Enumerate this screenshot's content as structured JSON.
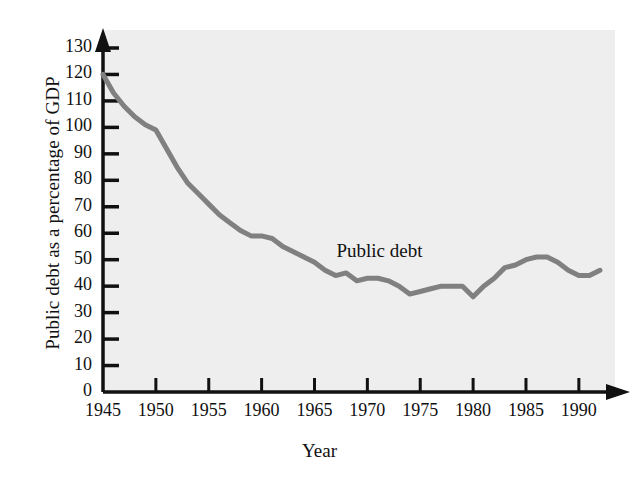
{
  "chart_data": {
    "type": "line",
    "title": "",
    "xlabel": "Year",
    "ylabel": "Public debt as a percentage of GDP",
    "xlim": [
      1945,
      1992
    ],
    "ylim": [
      0,
      130
    ],
    "grid": false,
    "legend": "none",
    "annotations": [
      {
        "text": "Public debt",
        "x": 1972,
        "y": 52
      }
    ],
    "y_ticks": [
      0,
      10,
      20,
      30,
      40,
      50,
      60,
      70,
      80,
      90,
      100,
      110,
      120,
      130
    ],
    "y_tick_labels": [
      "0",
      "10",
      "20",
      "30",
      "40",
      "50",
      "60",
      "70",
      "80",
      "90",
      "100",
      "110",
      "120",
      "130"
    ],
    "x_ticks": [
      1945,
      1950,
      1955,
      1960,
      1965,
      1970,
      1975,
      1980,
      1985,
      1990
    ],
    "x_tick_labels": [
      "1945",
      "1950",
      "1955",
      "1960",
      "1965",
      "1970",
      "1975",
      "1980",
      "1985",
      "1990"
    ],
    "series": [
      {
        "name": "Public debt",
        "color": "#808080",
        "x": [
          1945,
          1946,
          1947,
          1948,
          1949,
          1950,
          1951,
          1952,
          1953,
          1954,
          1955,
          1956,
          1957,
          1958,
          1959,
          1960,
          1961,
          1962,
          1963,
          1964,
          1965,
          1966,
          1967,
          1968,
          1969,
          1970,
          1971,
          1972,
          1973,
          1974,
          1975,
          1976,
          1977,
          1978,
          1979,
          1980,
          1981,
          1982,
          1983,
          1984,
          1985,
          1986,
          1987,
          1988,
          1989,
          1990,
          1991,
          1992
        ],
        "values": [
          120,
          113,
          108,
          104,
          101,
          99,
          92,
          85,
          79,
          75,
          71,
          67,
          64,
          61,
          59,
          59,
          58,
          55,
          53,
          51,
          49,
          46,
          44,
          45,
          42,
          43,
          43,
          42,
          40,
          37,
          38,
          39,
          40,
          40,
          40,
          36,
          40,
          43,
          47,
          48,
          50,
          51,
          51,
          49,
          46,
          44,
          44,
          46
        ]
      }
    ]
  }
}
